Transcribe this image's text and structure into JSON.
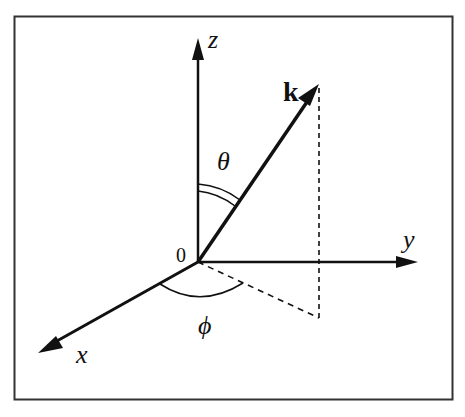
{
  "diagram": {
    "labels": {
      "z_axis": "z",
      "y_axis": "y",
      "x_axis": "x",
      "origin": "0",
      "vector": "k",
      "polar_angle": "θ",
      "azimuthal_angle": "ϕ"
    },
    "colors": {
      "ink": "#111111",
      "frame": "#333333",
      "background": "#ffffff"
    }
  }
}
